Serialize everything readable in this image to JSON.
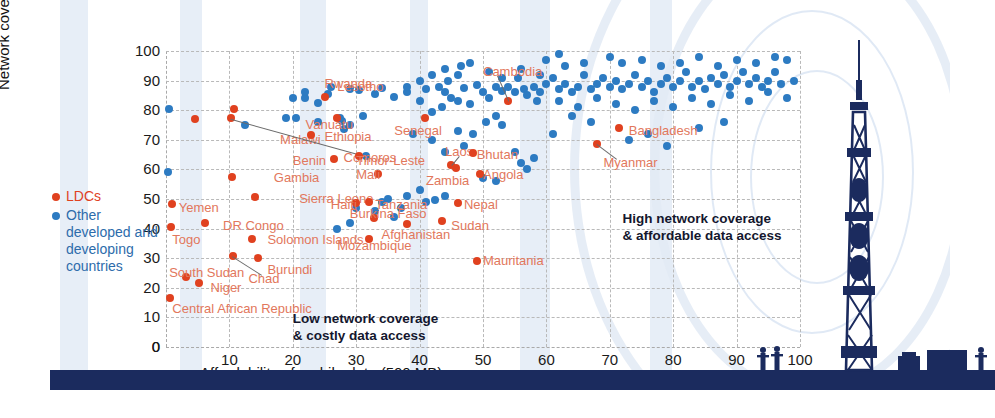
{
  "chart_data": {
    "type": "scatter",
    "title": "",
    "xlabel": "Affordability of mobile data (500 MB)",
    "ylabel": "Network coverage",
    "xlim": [
      0,
      100
    ],
    "ylim": [
      0,
      100
    ],
    "xticks": [
      0,
      10,
      20,
      30,
      40,
      50,
      60,
      70,
      80,
      90,
      100
    ],
    "yticks": [
      0,
      10,
      20,
      30,
      40,
      50,
      60,
      70,
      80,
      90,
      100
    ],
    "grid": true,
    "legend_position": "left",
    "series": [
      {
        "name": "LDCs",
        "color": "#e0411f",
        "marker": "circle"
      },
      {
        "name": "Other developed and developing countries",
        "color": "#2d7bc2",
        "marker": "circle"
      }
    ],
    "annotations": [
      {
        "id": "low",
        "text_line1": "Low network coverage",
        "text_line2": "& costly data access",
        "x": 20,
        "y": 12
      },
      {
        "id": "high",
        "text_line1": "High network coverage",
        "text_line2": "& affordable data access",
        "x": 72,
        "y": 46
      }
    ],
    "labeled_points": [
      {
        "label": "Lesotho",
        "x": 10.8,
        "y": 80.4,
        "group": "LDCs",
        "lx": 27,
        "ly": 88
      },
      {
        "label": "Malawi",
        "x": 4.5,
        "y": 77.0,
        "group": "LDCs",
        "lx": 18,
        "ly": 70
      },
      {
        "label": "Comoros",
        "x": 10.2,
        "y": 77.2,
        "group": "LDCs",
        "lx": 28,
        "ly": 64,
        "leader": true
      },
      {
        "label": "Gambia",
        "x": 10.4,
        "y": 57.5,
        "group": "LDCs",
        "lx": 17,
        "ly": 57
      },
      {
        "label": "Sierra Leone",
        "x": 14.0,
        "y": 50.8,
        "group": "LDCs",
        "lx": 21,
        "ly": 50
      },
      {
        "label": "Yemen",
        "x": 0.9,
        "y": 48.2,
        "group": "LDCs",
        "lx": 2,
        "ly": 47
      },
      {
        "label": "DR Congo",
        "x": 6.2,
        "y": 42.0,
        "group": "LDCs",
        "lx": 9,
        "ly": 41
      },
      {
        "label": "Togo",
        "x": 0.8,
        "y": 40.5,
        "group": "LDCs",
        "lx": 1,
        "ly": 36
      },
      {
        "label": "Solomon Islands",
        "x": 13.5,
        "y": 36.5,
        "group": "LDCs",
        "lx": 16,
        "ly": 36
      },
      {
        "label": "Chad",
        "x": 10.5,
        "y": 30.8,
        "group": "LDCs",
        "lx": 13,
        "ly": 23,
        "leader": true
      },
      {
        "label": "Burundi",
        "x": 14.5,
        "y": 30.0,
        "group": "LDCs",
        "lx": 16,
        "ly": 26
      },
      {
        "label": "South Sudan",
        "x": 3.2,
        "y": 23.5,
        "group": "LDCs",
        "lx": 0.5,
        "ly": 25
      },
      {
        "label": "Niger",
        "x": 5.2,
        "y": 21.5,
        "group": "LDCs",
        "lx": 7,
        "ly": 20
      },
      {
        "label": "Central African Republic",
        "x": 0.7,
        "y": 16.5,
        "group": "LDCs",
        "lx": 1,
        "ly": 13
      },
      {
        "label": "Rwanda",
        "x": 25.0,
        "y": 84.5,
        "group": "LDCs",
        "lx": 25,
        "ly": 89
      },
      {
        "label": "Vanuatu",
        "x": 27.0,
        "y": 77.5,
        "group": "LDCs",
        "lx": 22,
        "ly": 75
      },
      {
        "label": "Ethiopia",
        "x": 22.8,
        "y": 71.5,
        "group": "LDCs",
        "lx": 25,
        "ly": 71
      },
      {
        "label": "Benin",
        "x": 26.5,
        "y": 63.5,
        "group": "LDCs",
        "lx": 20,
        "ly": 63
      },
      {
        "label": "Timor-Leste",
        "x": 30.5,
        "y": 64.5,
        "group": "LDCs",
        "lx": 30,
        "ly": 63
      },
      {
        "label": "Senegal",
        "x": 40.8,
        "y": 77.5,
        "group": "LDCs",
        "lx": 36,
        "ly": 73
      },
      {
        "label": "Mali",
        "x": 33.5,
        "y": 58.5,
        "group": "LDCs",
        "lx": 30,
        "ly": 58
      },
      {
        "label": "Laos",
        "x": 45.0,
        "y": 61.5,
        "group": "LDCs",
        "lx": 44,
        "ly": 66,
        "leader": true
      },
      {
        "label": "Zambia",
        "x": 45.8,
        "y": 60.5,
        "group": "LDCs",
        "lx": 41,
        "ly": 56
      },
      {
        "label": "Bhutan",
        "x": 48.5,
        "y": 65.5,
        "group": "LDCs",
        "lx": 49,
        "ly": 65
      },
      {
        "label": "Angola",
        "x": 49.5,
        "y": 58.5,
        "group": "LDCs",
        "lx": 50,
        "ly": 58
      },
      {
        "label": "Cambodia",
        "x": 54.0,
        "y": 83.0,
        "group": "LDCs",
        "lx": 50,
        "ly": 93,
        "leader": true
      },
      {
        "label": "Tanzania",
        "x": 32.0,
        "y": 49.0,
        "group": "LDCs",
        "lx": 33,
        "ly": 48
      },
      {
        "label": "Haiti",
        "x": 30.0,
        "y": 48.5,
        "group": "LDCs",
        "lx": 26,
        "ly": 48
      },
      {
        "label": "Nepal",
        "x": 46.0,
        "y": 48.5,
        "group": "LDCs",
        "lx": 47,
        "ly": 48
      },
      {
        "label": "Burkina Faso",
        "x": 32.8,
        "y": 43.5,
        "group": "LDCs",
        "lx": 29,
        "ly": 45
      },
      {
        "label": "Mozambique",
        "x": 32.0,
        "y": 36.5,
        "group": "LDCs",
        "lx": 27,
        "ly": 34
      },
      {
        "label": "Afghanistan",
        "x": 38.0,
        "y": 41.5,
        "group": "LDCs",
        "lx": 34,
        "ly": 38
      },
      {
        "label": "Sudan",
        "x": 43.5,
        "y": 42.5,
        "group": "LDCs",
        "lx": 45,
        "ly": 41
      },
      {
        "label": "Mauritania",
        "x": 49.0,
        "y": 29.0,
        "group": "LDCs",
        "lx": 50,
        "ly": 29
      },
      {
        "label": "Bangladesh",
        "x": 71.5,
        "y": 74.0,
        "group": "LDCs",
        "lx": 73,
        "ly": 73
      },
      {
        "label": "Myanmar",
        "x": 68.0,
        "y": 68.5,
        "group": "LDCs",
        "lx": 69,
        "ly": 62,
        "leader": true
      }
    ],
    "other_points": [
      [
        0.5,
        80.5
      ],
      [
        12.5,
        75
      ],
      [
        0.3,
        59
      ],
      [
        19,
        77.5
      ],
      [
        20.5,
        77.3
      ],
      [
        25.5,
        85.5
      ],
      [
        24,
        82.5
      ],
      [
        22,
        84
      ],
      [
        27.5,
        77.5
      ],
      [
        27.8,
        76.5
      ],
      [
        28,
        73.5
      ],
      [
        29,
        87
      ],
      [
        30.5,
        86.8
      ],
      [
        33,
        85.5
      ],
      [
        34,
        87.5
      ],
      [
        31.5,
        64.5
      ],
      [
        38,
        86
      ],
      [
        36,
        84.5
      ],
      [
        40,
        83
      ],
      [
        41,
        87
      ],
      [
        42,
        79.5
      ],
      [
        43,
        88
      ],
      [
        44,
        86
      ],
      [
        45,
        84
      ],
      [
        43.5,
        81
      ],
      [
        46,
        83
      ],
      [
        47,
        87.5
      ],
      [
        48,
        82
      ],
      [
        44.5,
        90
      ],
      [
        46.5,
        95
      ],
      [
        49,
        88.5
      ],
      [
        50,
        86
      ],
      [
        51,
        84
      ],
      [
        52,
        88
      ],
      [
        53,
        86.5
      ],
      [
        46,
        73
      ],
      [
        48.5,
        72
      ],
      [
        50.5,
        76
      ],
      [
        52,
        78
      ],
      [
        53,
        75
      ],
      [
        54,
        88
      ],
      [
        55,
        86
      ],
      [
        55.5,
        91
      ],
      [
        56.5,
        87
      ],
      [
        57,
        85
      ],
      [
        58,
        88
      ],
      [
        58.5,
        83
      ],
      [
        59,
        86
      ],
      [
        50,
        57
      ],
      [
        52,
        56
      ],
      [
        56,
        62
      ],
      [
        57,
        60
      ],
      [
        41,
        49
      ],
      [
        42.5,
        49.5
      ],
      [
        44,
        51
      ],
      [
        37,
        47
      ],
      [
        35,
        50
      ],
      [
        60,
        89
      ],
      [
        61,
        91
      ],
      [
        62,
        87
      ],
      [
        63,
        89
      ],
      [
        64,
        86
      ],
      [
        65,
        88
      ],
      [
        66,
        92
      ],
      [
        67,
        87
      ],
      [
        68,
        89
      ],
      [
        69,
        91
      ],
      [
        70,
        88
      ],
      [
        71,
        90
      ],
      [
        72,
        87
      ],
      [
        73,
        89
      ],
      [
        74,
        92
      ],
      [
        75,
        88
      ],
      [
        76,
        90
      ],
      [
        77,
        86
      ],
      [
        78,
        89
      ],
      [
        79,
        91
      ],
      [
        80,
        88
      ],
      [
        81,
        90
      ],
      [
        82,
        93
      ],
      [
        83,
        88
      ],
      [
        84,
        90
      ],
      [
        85,
        87
      ],
      [
        86,
        91
      ],
      [
        87,
        89
      ],
      [
        88,
        92
      ],
      [
        89,
        88
      ],
      [
        90,
        90
      ],
      [
        91,
        93
      ],
      [
        92,
        89
      ],
      [
        93,
        91
      ],
      [
        94,
        88
      ],
      [
        95,
        90
      ],
      [
        96,
        93
      ],
      [
        97,
        89
      ],
      [
        98,
        97
      ],
      [
        99,
        90
      ],
      [
        60,
        97
      ],
      [
        63,
        95
      ],
      [
        66,
        96
      ],
      [
        70,
        98
      ],
      [
        72,
        96
      ],
      [
        75,
        97
      ],
      [
        78,
        95
      ],
      [
        81,
        96
      ],
      [
        84,
        98
      ],
      [
        87,
        95
      ],
      [
        90,
        97
      ],
      [
        93,
        96
      ],
      [
        96,
        98
      ],
      [
        62,
        83
      ],
      [
        65,
        81
      ],
      [
        68,
        84
      ],
      [
        71,
        82
      ],
      [
        74,
        80
      ],
      [
        77,
        83
      ],
      [
        80,
        81
      ],
      [
        83,
        84
      ],
      [
        86,
        82
      ],
      [
        89,
        85
      ],
      [
        92,
        83
      ],
      [
        95,
        86
      ],
      [
        98,
        84
      ],
      [
        64,
        78
      ],
      [
        67,
        76
      ],
      [
        73,
        70
      ],
      [
        76,
        72
      ],
      [
        79,
        68
      ],
      [
        84,
        74
      ],
      [
        88,
        76
      ],
      [
        55,
        66
      ],
      [
        58,
        64
      ],
      [
        61,
        72
      ],
      [
        30,
        47
      ],
      [
        33,
        46
      ],
      [
        36,
        44
      ],
      [
        22,
        86
      ],
      [
        26,
        88
      ],
      [
        20,
        84
      ],
      [
        24,
        76
      ],
      [
        29,
        75
      ],
      [
        31,
        78
      ],
      [
        38,
        88
      ],
      [
        40,
        90
      ],
      [
        42,
        92
      ],
      [
        44,
        94
      ],
      [
        46,
        92
      ],
      [
        48,
        96
      ],
      [
        51,
        93
      ],
      [
        53,
        91
      ],
      [
        56,
        94
      ],
      [
        59,
        92
      ],
      [
        62,
        99
      ],
      [
        34,
        49
      ],
      [
        38,
        51
      ],
      [
        40,
        53
      ],
      [
        29,
        42
      ],
      [
        27,
        40
      ],
      [
        44,
        66
      ],
      [
        47,
        68
      ],
      [
        42,
        70
      ],
      [
        39,
        72
      ]
    ]
  },
  "legend": {
    "ldc_label": "LDCs",
    "other_label": "Other developed and developing countries"
  },
  "decor": {
    "tower_name": "cell-tower-illustration"
  }
}
